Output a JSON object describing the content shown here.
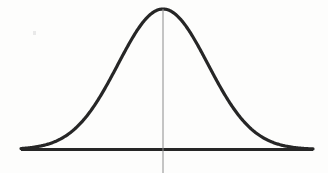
{
  "figure": {
    "background_color": "#fdfdfc",
    "width": 328,
    "height": 173
  },
  "elements": {
    "curve": {
      "name": "bell-curve",
      "color": "#262626",
      "stroke_width": 3.2
    },
    "baseline": {
      "name": "horizontal-axis",
      "color": "#262626",
      "stroke_width": 3.2,
      "x_start": 21,
      "x_end": 313,
      "y": 149.5
    },
    "center_line": {
      "name": "mean-vertical-line",
      "color": "#8c8c8c",
      "stroke_width": 1,
      "x": 163,
      "y_top": 9,
      "y_bottom": 173
    },
    "artifact": {
      "name": "scan-speck",
      "color": "#d8d8d8",
      "x": 33,
      "y": 31,
      "width": 3,
      "height": 4
    }
  },
  "chart_data": {
    "type": "line",
    "subtitle": "",
    "xlabel": "",
    "ylabel": "",
    "legend": [],
    "grid": false,
    "axis": {
      "x_axis_visible": true,
      "y_axis_visible": false,
      "baseline_y_pixel": 149.5,
      "x_range_pixels": [
        21,
        313
      ]
    },
    "annotations": [
      {
        "name": "mean-line",
        "type": "vline",
        "x_pixel": 163,
        "label": ""
      }
    ],
    "distribution": {
      "family": "gaussian",
      "mean_pixel_x": 163,
      "sigma_pixel": 45,
      "peak_pixel_y": 9,
      "baseline_pixel_y": 149.5,
      "amplitude_pixels": 140.5,
      "fwhm_pixels": 106,
      "half_max_pixel_x": [
        110,
        216
      ]
    },
    "x": [
      21,
      32,
      43,
      54,
      65,
      76,
      87,
      98,
      109,
      120,
      131,
      142,
      152,
      163,
      174,
      185,
      196,
      207,
      218,
      229,
      240,
      251,
      262,
      273,
      284,
      295,
      306,
      313
    ],
    "y": [
      146.9,
      145.7,
      143.6,
      140.1,
      134.5,
      126.1,
      114.3,
      98.9,
      80.4,
      60.1,
      40.4,
      24.1,
      14.2,
      9.0,
      13.1,
      22.5,
      38.1,
      57.5,
      78.0,
      96.9,
      112.7,
      124.9,
      133.6,
      139.6,
      143.4,
      145.7,
      147.0,
      147.4
    ],
    "values_normalized": [
      0.02,
      0.03,
      0.04,
      0.07,
      0.11,
      0.17,
      0.25,
      0.36,
      0.49,
      0.64,
      0.78,
      0.89,
      0.96,
      1.0,
      0.97,
      0.9,
      0.79,
      0.65,
      0.51,
      0.37,
      0.26,
      0.17,
      0.11,
      0.07,
      0.04,
      0.03,
      0.02,
      0.02
    ]
  }
}
